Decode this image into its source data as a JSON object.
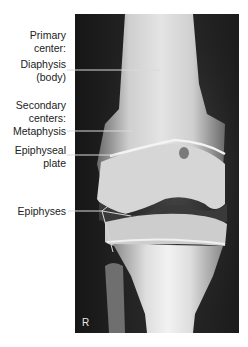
{
  "figure": {
    "side_marker": "R",
    "labels": {
      "primary_center_line1": "Primary",
      "primary_center_line2": "center:",
      "diaphysis_line1": "Diaphysis",
      "diaphysis_line2": "(body)",
      "secondary_centers_line1": "Secondary",
      "secondary_centers_line2": "centers:",
      "metaphysis": "Metaphysis",
      "epiphyseal_plate_line1": "Epiphyseal",
      "epiphyseal_plate_line2": "plate",
      "epiphyses": "Epiphyses"
    },
    "colors": {
      "background": "#ffffff",
      "label_text": "#222222",
      "leader_line": "#d9d9d9",
      "film_dark": "#1a1a1a"
    }
  }
}
